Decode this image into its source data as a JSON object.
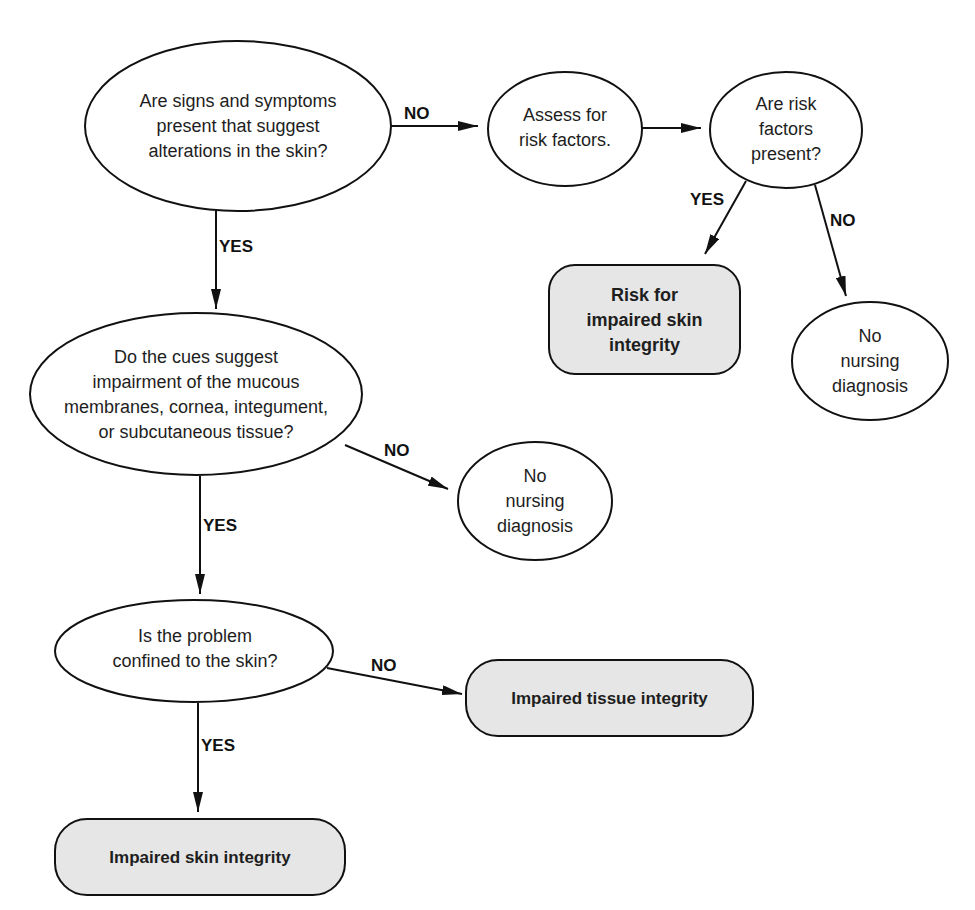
{
  "diagram": {
    "type": "flowchart",
    "colors": {
      "stroke": "#111111",
      "decision_fill": "#ffffff",
      "outcome_fill": "#e6e6e6"
    },
    "nodes": {
      "q_signs": {
        "shape": "ellipse",
        "text": "Are signs and symptoms\npresent that suggest\nalterations in the skin?"
      },
      "assess_risk": {
        "shape": "ellipse",
        "text": "Assess for\nrisk factors."
      },
      "q_risk_present": {
        "shape": "ellipse",
        "text": "Are risk\nfactors\npresent?"
      },
      "risk_impaired_skin": {
        "shape": "rounded-rect",
        "text": "Risk for\nimpaired skin\nintegrity"
      },
      "no_dx_1": {
        "shape": "ellipse",
        "text": "No\nnursing\ndiagnosis"
      },
      "q_cues": {
        "shape": "ellipse",
        "text": "Do the cues suggest\nimpairment of the mucous\nmembranes, cornea, integument,\nor subcutaneous tissue?"
      },
      "no_dx_2": {
        "shape": "ellipse",
        "text": "No\nnursing\ndiagnosis"
      },
      "q_confined": {
        "shape": "ellipse",
        "text": "Is the problem\nconfined to the skin?"
      },
      "impaired_tissue": {
        "shape": "rounded-rect",
        "text": "Impaired tissue integrity"
      },
      "impaired_skin": {
        "shape": "rounded-rect",
        "text": "Impaired skin integrity"
      }
    },
    "edges": [
      {
        "from": "q_signs",
        "to": "assess_risk",
        "label": "NO"
      },
      {
        "from": "assess_risk",
        "to": "q_risk_present",
        "label": ""
      },
      {
        "from": "q_risk_present",
        "to": "risk_impaired_skin",
        "label": "YES"
      },
      {
        "from": "q_risk_present",
        "to": "no_dx_1",
        "label": "NO"
      },
      {
        "from": "q_signs",
        "to": "q_cues",
        "label": "YES"
      },
      {
        "from": "q_cues",
        "to": "no_dx_2",
        "label": "NO"
      },
      {
        "from": "q_cues",
        "to": "q_confined",
        "label": "YES"
      },
      {
        "from": "q_confined",
        "to": "impaired_tissue",
        "label": "NO"
      },
      {
        "from": "q_confined",
        "to": "impaired_skin",
        "label": "YES"
      }
    ],
    "labels": {
      "e1": "NO",
      "e3": "YES",
      "e4": "NO",
      "e5": "YES",
      "e6": "NO",
      "e7": "YES",
      "e8": "NO",
      "e9": "YES"
    }
  }
}
